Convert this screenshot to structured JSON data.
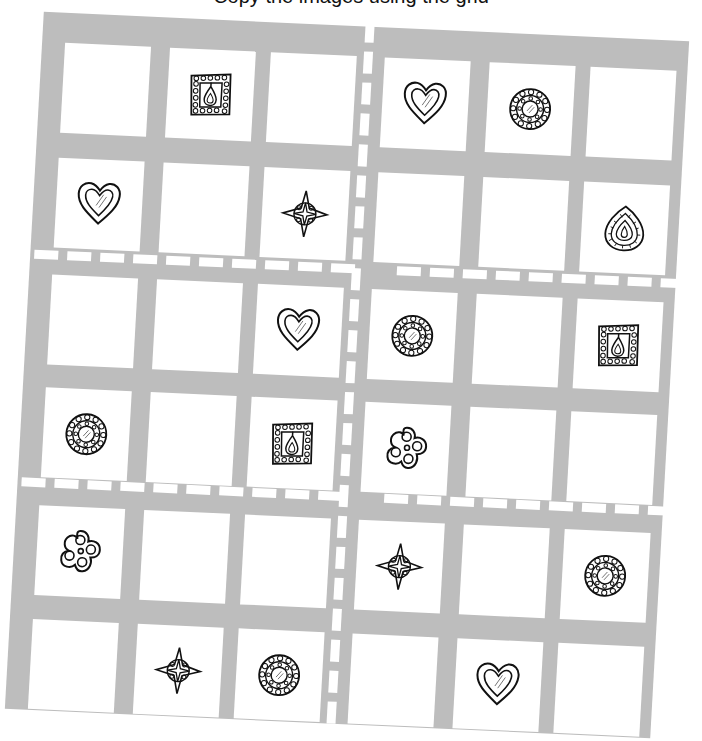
{
  "caption": "Copy the images using the grid",
  "board": {
    "rows": 6,
    "cols": 6,
    "region_rows": 2,
    "region_cols": 3,
    "background_color": "#bdbdbd",
    "cell_color": "#ffffff",
    "divider_color": "#ffffff",
    "divider_style": "dashed"
  },
  "icons": {
    "heart": "heart-icon",
    "mandala": "mandala-icon",
    "square": "square-frame-icon",
    "star": "star-icon",
    "teardrop": "teardrop-icon",
    "flower": "flower-icon"
  },
  "grid": [
    [
      "",
      "square",
      "",
      "heart",
      "mandala",
      ""
    ],
    [
      "heart",
      "",
      "star",
      "",
      "",
      "teardrop"
    ],
    [
      "",
      "",
      "heart",
      "mandala",
      "",
      "square"
    ],
    [
      "mandala",
      "",
      "square",
      "flower",
      "",
      ""
    ],
    [
      "flower",
      "",
      "",
      "star",
      "",
      "mandala"
    ],
    [
      "",
      "star",
      "mandala",
      "",
      "heart",
      ""
    ]
  ]
}
